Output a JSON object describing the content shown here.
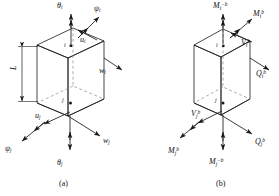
{
  "figure": {
    "type": "engineering-diagram",
    "panels": [
      {
        "id": "a",
        "caption": "(a)",
        "dimension_label": "L",
        "node_top": "i",
        "node_bottom": "j",
        "vectors": [
          {
            "name": "theta-i",
            "base": "θ",
            "sub": "i",
            "sup": "",
            "x": 57,
            "y": 2,
            "kind": "rotation"
          },
          {
            "name": "psi-i",
            "base": "ψ",
            "sub": "i",
            "sup": "",
            "x": 94,
            "y": 5,
            "kind": "rotation"
          },
          {
            "name": "u-i",
            "base": "u",
            "sub": "i",
            "sup": "",
            "x": 80,
            "y": 36,
            "kind": "translation"
          },
          {
            "name": "w-i",
            "base": "w",
            "sub": "i",
            "sup": "",
            "x": 99,
            "y": 67,
            "kind": "translation"
          },
          {
            "name": "u-j",
            "base": "u",
            "sub": "j",
            "sup": "",
            "x": 35,
            "y": 112,
            "kind": "translation"
          },
          {
            "name": "w-j",
            "base": "w",
            "sub": "j",
            "sup": "",
            "x": 103,
            "y": 137,
            "kind": "translation"
          },
          {
            "name": "psi-j",
            "base": "ψ",
            "sub": "j",
            "sup": "",
            "x": 5,
            "y": 145,
            "kind": "rotation"
          },
          {
            "name": "theta-j",
            "base": "θ",
            "sub": "j",
            "sup": "",
            "x": 57,
            "y": 159,
            "kind": "rotation"
          }
        ]
      },
      {
        "id": "b",
        "caption": "(b)",
        "node_top": "i",
        "node_bottom": "j",
        "vectors": [
          {
            "name": "moment-i-minus-b",
            "base": "M",
            "sub": "i",
            "sup": "−b",
            "x": 213,
            "y": 2,
            "kind": "moment"
          },
          {
            "name": "moment-i-b",
            "base": "M",
            "sub": "i",
            "sup": "b",
            "x": 253,
            "y": 10,
            "kind": "moment"
          },
          {
            "name": "shear-i-b",
            "base": "V",
            "sub": "i",
            "sup": "b",
            "x": 241,
            "y": 39,
            "kind": "shear"
          },
          {
            "name": "axial-i-b",
            "base": "Q",
            "sub": "i",
            "sup": "b",
            "x": 256,
            "y": 70,
            "kind": "axial"
          },
          {
            "name": "shear-j-b",
            "base": "V",
            "sub": "j",
            "sup": "b",
            "x": 191,
            "y": 110,
            "kind": "shear"
          },
          {
            "name": "axial-j-b",
            "base": "Q",
            "sub": "j",
            "sup": "b",
            "x": 255,
            "y": 138,
            "kind": "axial"
          },
          {
            "name": "moment-j-b",
            "base": "M",
            "sub": "j",
            "sup": "b",
            "x": 168,
            "y": 147,
            "kind": "moment"
          },
          {
            "name": "moment-j-minus-b",
            "base": "M",
            "sub": "j",
            "sup": "−b",
            "x": 209,
            "y": 158,
            "kind": "moment"
          }
        ]
      }
    ],
    "colors": {
      "line": "#1a1a1a",
      "hidden_line": "#8a8a8a",
      "background": "#ffffff"
    }
  }
}
